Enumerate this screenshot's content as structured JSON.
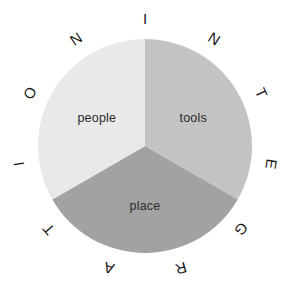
{
  "chart_data": {
    "type": "pie",
    "title": "INTEGRATION",
    "subtitle": "",
    "xlabel": "",
    "ylabel": "",
    "categories": [
      "tools",
      "place",
      "people"
    ],
    "values": [
      33.3,
      33.3,
      33.3
    ],
    "labels": [
      "tools",
      "place",
      "people"
    ],
    "colors": [
      "#c3c3c3",
      "#a2a2a2",
      "#e9e9e9"
    ],
    "start_angle_deg": 0,
    "direction": "clockwise",
    "slices": [
      {
        "label": "tools",
        "value": 33.3,
        "color": "#c3c3c3",
        "start_deg": 0,
        "end_deg": 120
      },
      {
        "label": "place",
        "value": 33.3,
        "color": "#a2a2a2",
        "start_deg": 120,
        "end_deg": 240
      },
      {
        "label": "people",
        "value": 33.3,
        "color": "#e9e9e9",
        "start_deg": 240,
        "end_deg": 360
      }
    ],
    "legend": "none",
    "grid": false,
    "annotations": [
      "INTEGRATION"
    ]
  },
  "diagram": {
    "ring_word": "INTEGRATION",
    "ring_letters": [
      "I",
      "N",
      "T",
      "E",
      "G",
      "R",
      "A",
      "T",
      "I",
      "O",
      "N"
    ],
    "center_label": "",
    "slice_labels": {
      "tools": "tools",
      "place": "place",
      "people": "people"
    }
  },
  "geometry": {
    "center_x": 145,
    "center_y": 146,
    "radius": 107,
    "ring_radius": 127
  },
  "colors": {
    "background": "#ffffff",
    "tools_fill": "#c3c3c3",
    "place_fill": "#a2a2a2",
    "people_fill": "#e9e9e9",
    "letter_color": "#171717",
    "label_color": "#2b2b2b"
  }
}
